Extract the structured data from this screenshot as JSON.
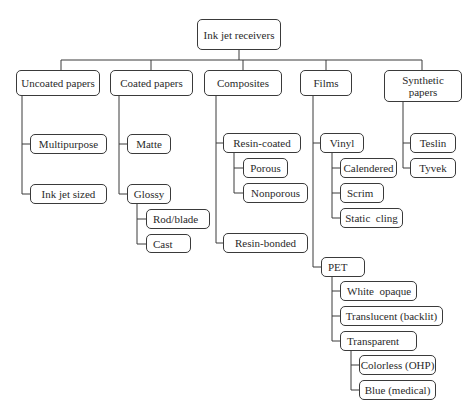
{
  "diagram": {
    "title": "Ink jet receivers",
    "root": {
      "id": "root",
      "label": "Ink jet receivers"
    },
    "categories": [
      {
        "id": "uncoated",
        "label": "Uncoated papers",
        "children": [
          {
            "id": "multipurpose",
            "label": "Multipurpose"
          },
          {
            "id": "inkjet-sized",
            "label": "Ink jet sized"
          }
        ]
      },
      {
        "id": "coated",
        "label": "Coated papers",
        "children": [
          {
            "id": "matte",
            "label": "Matte"
          },
          {
            "id": "glossy",
            "label": "Glossy",
            "children": [
              {
                "id": "rod-blade",
                "label": "Rod/blade"
              },
              {
                "id": "cast",
                "label": "Cast"
              }
            ]
          }
        ]
      },
      {
        "id": "composites",
        "label": "Composites",
        "children": [
          {
            "id": "resin-coated",
            "label": "Resin-coated",
            "children": [
              {
                "id": "porous",
                "label": "Porous"
              },
              {
                "id": "nonporous",
                "label": "Nonporous"
              }
            ]
          },
          {
            "id": "resin-bonded",
            "label": "Resin-bonded"
          }
        ]
      },
      {
        "id": "films",
        "label": "Films",
        "children": [
          {
            "id": "vinyl",
            "label": "Vinyl",
            "children": [
              {
                "id": "calendered",
                "label": "Calendered"
              },
              {
                "id": "scrim",
                "label": "Scrim"
              },
              {
                "id": "static-cling",
                "label": "Static  cling"
              }
            ]
          },
          {
            "id": "pet",
            "label": "PET",
            "children": [
              {
                "id": "white-opaque",
                "label": "White  opaque"
              },
              {
                "id": "translucent",
                "label": "Translucent (backlit)"
              },
              {
                "id": "transparent",
                "label": "Transparent",
                "children": [
                  {
                    "id": "colorless",
                    "label": "Colorless (OHP)"
                  },
                  {
                    "id": "blue",
                    "label": "Blue (medical)"
                  }
                ]
              }
            ]
          }
        ]
      },
      {
        "id": "synthetic",
        "label": "Synthetic papers",
        "children": [
          {
            "id": "teslin",
            "label": "Teslin"
          },
          {
            "id": "tyvek",
            "label": "Tyvek"
          }
        ]
      }
    ]
  },
  "colors": {
    "line": "#3a3a3a",
    "box_border": "#3a3a3a",
    "background": "#ffffff",
    "text": "#2a2a2a"
  }
}
